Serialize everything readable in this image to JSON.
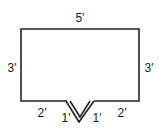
{
  "diagram": {
    "type": "floor-plan outline with V-notch",
    "dimensions": {
      "top": "5'",
      "left": "3'",
      "right": "3'",
      "bottom_left": "2'",
      "bottom_right": "2'",
      "notch_left": "1'",
      "notch_right": "1'"
    },
    "colors": {
      "line": "#222222",
      "background": "#ffffff"
    }
  }
}
